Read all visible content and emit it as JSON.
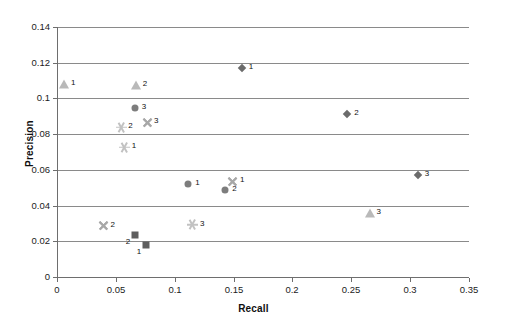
{
  "chart_data": {
    "type": "scatter",
    "title": "",
    "xlabel": "Recall",
    "ylabel": "Precision",
    "xlim": [
      0,
      0.35
    ],
    "ylim": [
      0,
      0.14
    ],
    "xticks": [
      "0",
      "0.05",
      "0.1",
      "0.15",
      "0.2",
      "0.25",
      "0.3",
      "0.35"
    ],
    "xtick_values": [
      0,
      0.05,
      0.1,
      0.15,
      0.2,
      0.25,
      0.3,
      0.35
    ],
    "yticks": [
      "0",
      "0.02",
      "0.04",
      "0.06",
      "0.08",
      "0.1",
      "0.12",
      "0.14"
    ],
    "ytick_values": [
      0,
      0.02,
      0.04,
      0.06,
      0.08,
      0.1,
      0.12,
      0.14
    ],
    "grid": "horizontal",
    "legend": "none",
    "colors": {
      "diamond": "#6b6b6b",
      "square": "#5e5e5e",
      "triangle": "#b9b9b9",
      "circle": "#7d7d7d",
      "cross": "#a8a8a8",
      "star": "#c2c2c2",
      "axis": "#6e6e6e",
      "gridline": "#8a8a8a",
      "text": "#111111"
    },
    "series": [
      {
        "name": "diamond",
        "marker": "diamond",
        "color": "#6b6b6b",
        "points": [
          {
            "x": 0.157,
            "y": 0.1168,
            "label": "1",
            "label_pos": "right"
          },
          {
            "x": 0.2465,
            "y": 0.0915,
            "label": "2",
            "label_pos": "right"
          },
          {
            "x": 0.3065,
            "y": 0.0572,
            "label": "3",
            "label_pos": "right"
          }
        ]
      },
      {
        "name": "square",
        "marker": "square",
        "color": "#5e5e5e",
        "points": [
          {
            "x": 0.066,
            "y": 0.0236,
            "label": "2",
            "label_pos": "below"
          },
          {
            "x": 0.0755,
            "y": 0.0178,
            "label": "1",
            "label_pos": "below"
          }
        ]
      },
      {
        "name": "triangle",
        "marker": "triangle",
        "color": "#b9b9b9",
        "points": [
          {
            "x": 0.006,
            "y": 0.108,
            "label": "1",
            "label_pos": "right"
          },
          {
            "x": 0.067,
            "y": 0.1075,
            "label": "2",
            "label_pos": "right"
          },
          {
            "x": 0.2655,
            "y": 0.0358,
            "label": "3",
            "label_pos": "right"
          }
        ]
      },
      {
        "name": "circle",
        "marker": "circle",
        "color": "#7d7d7d",
        "points": [
          {
            "x": 0.066,
            "y": 0.0948,
            "label": "3",
            "label_pos": "right"
          },
          {
            "x": 0.1115,
            "y": 0.0522,
            "label": "1",
            "label_pos": "right"
          },
          {
            "x": 0.143,
            "y": 0.0487,
            "label": "2",
            "label_pos": "right"
          }
        ]
      },
      {
        "name": "cross",
        "marker": "x",
        "color": "#a8a8a8",
        "points": [
          {
            "x": 0.0765,
            "y": 0.0867,
            "label": "3",
            "label_pos": "right"
          },
          {
            "x": 0.1495,
            "y": 0.0537,
            "label": "1",
            "label_pos": "right"
          },
          {
            "x": 0.0395,
            "y": 0.0287,
            "label": "2",
            "label_pos": "right"
          }
        ]
      },
      {
        "name": "star",
        "marker": "asterisk",
        "color": "#c2c2c2",
        "points": [
          {
            "x": 0.0545,
            "y": 0.0838,
            "label": "2",
            "label_pos": "right"
          },
          {
            "x": 0.0575,
            "y": 0.0728,
            "label": "1",
            "label_pos": "right"
          },
          {
            "x": 0.1155,
            "y": 0.0293,
            "label": "3",
            "label_pos": "right"
          }
        ]
      }
    ]
  }
}
